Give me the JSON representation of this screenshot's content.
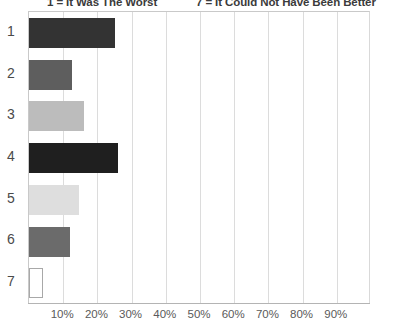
{
  "header": {
    "left_note": "1 = It Was The Worst",
    "right_note": "7 = It Could Not Have Been Better"
  },
  "chart_data": {
    "type": "bar",
    "orientation": "horizontal",
    "title": "",
    "subtitle": "",
    "xlabel": "",
    "ylabel": "",
    "categories": [
      "1",
      "2",
      "3",
      "4",
      "5",
      "6",
      "7"
    ],
    "values": [
      25,
      12.6,
      16,
      26,
      14.7,
      12,
      4
    ],
    "value_format": "percent",
    "xlim": [
      0,
      100
    ],
    "xticks": [
      10,
      20,
      30,
      40,
      50,
      60,
      70,
      80,
      90
    ],
    "xtick_labels": [
      "10%",
      "20%",
      "30%",
      "40%",
      "50%",
      "60%",
      "70%",
      "80%",
      "90%"
    ],
    "grid": true,
    "grid_axis": "x",
    "legend": false,
    "bar_colors": [
      "#333333",
      "#5e5e5e",
      "#bcbcbc",
      "#1f1f1f",
      "#dedede",
      "#6b6b6b",
      "#ffffff"
    ],
    "bar_border_colors": [
      "#333333",
      "#5e5e5e",
      "#bcbcbc",
      "#1f1f1f",
      "#dedede",
      "#6b6b6b",
      "#a8a8a8"
    ],
    "annotations": [
      "1 = It Was The Worst",
      "7 = It Could Not Have Been Better"
    ]
  },
  "colors": {
    "gridline": "#dcdcdc",
    "axis": "#b4b4b4",
    "tick_text": "#5a5a5a",
    "category_text": "#4a4a4a",
    "header_text": "#3b3b3b",
    "background": "#ffffff"
  }
}
